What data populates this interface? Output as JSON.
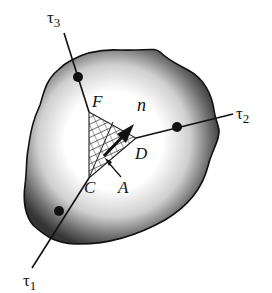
{
  "diagram": {
    "labels": {
      "tau1": "τ",
      "tau1_sub": "1",
      "tau2": "τ",
      "tau2_sub": "2",
      "tau3": "τ",
      "tau3_sub": "3",
      "F": "F",
      "D": "D",
      "C": "C",
      "A": "A",
      "n": "n"
    },
    "colors": {
      "outline": "#111111",
      "shade_dark": "#3a3a3a",
      "shade_light": "#ffffff",
      "background": "#ffffff"
    }
  }
}
